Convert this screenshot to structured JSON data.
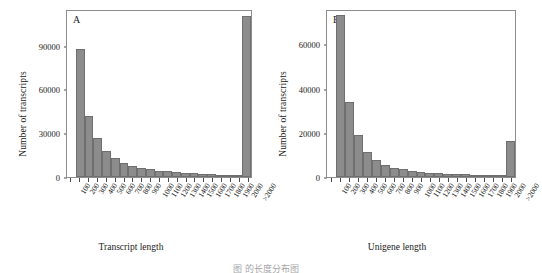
{
  "figure": {
    "caption_partial": "图           的长度分布图"
  },
  "chart_data": [
    {
      "type": "bar",
      "panel_label": "A",
      "title": "",
      "xlabel": "Transcript length",
      "ylabel": "Number of transcripts",
      "ylim": [
        0,
        115000
      ],
      "yticks": [
        0,
        30000,
        60000,
        90000
      ],
      "ytick_labels": [
        "0",
        "30000",
        "60000",
        "90000"
      ],
      "grid": false,
      "legend": "none",
      "categories": [
        "100",
        "200",
        "300",
        "400",
        "500",
        "600",
        "700",
        "800",
        "900",
        "1000",
        "1100",
        "1200",
        "1300",
        "1400",
        "1500",
        "1600",
        "1700",
        "1800",
        "1900",
        "2000",
        ">2000"
      ],
      "values": [
        0,
        87500,
        42000,
        26500,
        18000,
        13000,
        9500,
        7800,
        6200,
        5200,
        4400,
        3900,
        3300,
        2900,
        2500,
        2200,
        1900,
        1700,
        1500,
        1300,
        110000
      ]
    },
    {
      "type": "bar",
      "panel_label": "B",
      "title": "",
      "xlabel": "Unigene length",
      "ylabel": "Number of transcripts",
      "ylim": [
        0,
        76000
      ],
      "yticks": [
        0,
        20000,
        40000,
        60000
      ],
      "ytick_labels": [
        "0",
        "20000",
        "40000",
        "60000"
      ],
      "grid": false,
      "legend": "none",
      "categories": [
        "100",
        "200",
        "300",
        "400",
        "500",
        "600",
        "700",
        "800",
        "900",
        "1000",
        "1100",
        "1200",
        "1300",
        "1400",
        "1500",
        "1600",
        "1700",
        "1800",
        "1900",
        "2000",
        ">2000"
      ],
      "values": [
        0,
        73500,
        34000,
        19200,
        11500,
        7600,
        5300,
        4100,
        3400,
        2800,
        2400,
        2000,
        1700,
        1500,
        1300,
        1150,
        1000,
        900,
        800,
        700,
        16200
      ]
    }
  ]
}
